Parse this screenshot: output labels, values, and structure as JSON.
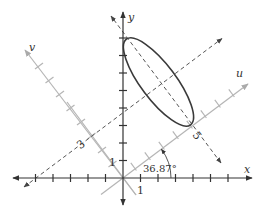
{
  "labels": {
    "x_axis": "x",
    "y_axis": "y",
    "u_axis": "u",
    "v_axis": "v",
    "x_unit": "1",
    "y_unit": "1",
    "u_tick": "5",
    "v_tick": "3",
    "angle": "36.87°"
  },
  "geometry": {
    "origin": [
      123,
      178
    ],
    "unit_px": 17.5,
    "rotation_deg": 36.87,
    "ellipse": {
      "center_uv": [
        5,
        3
      ],
      "semi_u": 1,
      "semi_v": 3
    }
  },
  "colors": {
    "main_axes": "#333333",
    "rotated_axes": "#b3b3b3",
    "dashed": "#555555",
    "ellipse": "#3a3a3a"
  }
}
